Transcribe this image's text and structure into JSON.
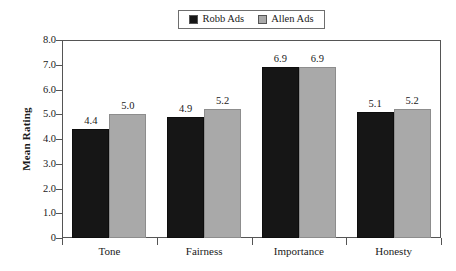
{
  "chart_data": {
    "type": "bar",
    "title": "",
    "subtitle": "",
    "xlabel": "",
    "ylabel": "Mean Rating",
    "categories": [
      "Tone",
      "Fairness",
      "Importance",
      "Honesty"
    ],
    "series": [
      {
        "name": "Robb Ads",
        "color": "#161616",
        "values": [
          4.4,
          4.9,
          6.9,
          5.1
        ]
      },
      {
        "name": "Allen Ads",
        "color": "#a9a9a9",
        "values": [
          5.0,
          5.2,
          6.9,
          5.2
        ]
      }
    ],
    "ylim": [
      0,
      8.0
    ],
    "ytick_values": [
      0,
      1.0,
      2.0,
      3.0,
      4.0,
      5.0,
      6.0,
      7.0,
      8.0
    ],
    "ytick_labels": [
      "0",
      "1.0",
      "2.0",
      "3.0",
      "4.0",
      "5.0",
      "6.0",
      "7.0",
      "8.0"
    ],
    "grid": false,
    "legend_position": "top-center",
    "data_labels": true,
    "bar_value_labels": [
      [
        "4.4",
        "5.0"
      ],
      [
        "4.9",
        "5.2"
      ],
      [
        "6.9",
        "6.9"
      ],
      [
        "5.1",
        "5.2"
      ]
    ]
  },
  "legend": {
    "entries": [
      {
        "label": "Robb Ads",
        "swatch": "legend-swatch-robb",
        "color": "#161616"
      },
      {
        "label": "Allen Ads",
        "swatch": "legend-swatch-allen",
        "color": "#a9a9a9"
      }
    ]
  },
  "axes": {
    "y_title": "Mean Rating"
  }
}
